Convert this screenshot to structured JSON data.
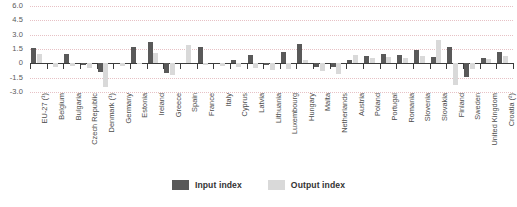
{
  "chart_data": {
    "type": "bar",
    "title": "",
    "subtitle": "",
    "xlabel": "",
    "ylabel": "",
    "ylim": [
      -3.0,
      6.0
    ],
    "yticks": [
      "6.0",
      "4.5",
      "3.0",
      "1.5",
      "0",
      "-1.5",
      "-3.0"
    ],
    "ytick_values": [
      6.0,
      4.5,
      3.0,
      1.5,
      0,
      -1.5,
      -3.0
    ],
    "grid": true,
    "legend_position": "bottom-center",
    "orientation": "vertical",
    "grouping": "grouped",
    "categories": [
      "EU-27 (¹)",
      "Belgium",
      "Bulgaria",
      "Czech Republic",
      "Denmark (¹)",
      "Germany",
      "Estonia",
      "Ireland",
      "Greece",
      "Spain",
      "France",
      "Italy",
      "Cyprus",
      "Latvia",
      "Lithuania",
      "Luxembourg",
      "Hungary",
      "Malta",
      "Netherlands",
      "Austria",
      "Poland",
      "Portugal",
      "Romania",
      "Slovenia",
      "Slovakia",
      "Finland",
      "Sweden",
      "United Kingdom",
      "Croatia (²)"
    ],
    "series": [
      {
        "name": "Input index",
        "color": "#595959",
        "values": [
          1.6,
          0.0,
          1.0,
          -0.2,
          -0.9,
          0.0,
          1.7,
          2.2,
          -1.0,
          0.0,
          1.7,
          0.0,
          0.4,
          0.9,
          -0.2,
          1.2,
          2.0,
          -0.4,
          -0.4,
          0.3,
          0.8,
          1.0,
          0.9,
          1.4,
          0.7,
          1.7,
          -1.4,
          0.6,
          1.2
        ]
      },
      {
        "name": "Output index",
        "color": "#d9d9d9",
        "values": [
          1.0,
          -0.4,
          -0.3,
          -0.5,
          -2.5,
          -0.3,
          -0.1,
          1.1,
          -1.2,
          1.9,
          -0.2,
          -0.3,
          -0.4,
          -0.5,
          -0.7,
          -0.6,
          0.3,
          -0.8,
          -1.1,
          0.9,
          0.6,
          0.7,
          0.6,
          0.8,
          2.4,
          -2.3,
          -0.6,
          0.5,
          0.8
        ]
      }
    ]
  },
  "legend": {
    "items": [
      {
        "label": "Input index",
        "color": "#595959"
      },
      {
        "label": "Output index",
        "color": "#d9d9d9"
      }
    ]
  },
  "colors": {
    "input": "#595959",
    "output": "#d9d9d9",
    "gridline": "#e3b7bb",
    "axis": "#3b3b3b",
    "text": "#4d4d4d"
  }
}
